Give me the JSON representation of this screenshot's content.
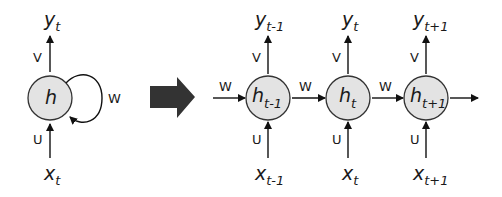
{
  "colors": {
    "node_fill": "#e3e3e3",
    "node_stroke": "#333333",
    "arrow": "#111111",
    "big_arrow": "#333333",
    "background": "#ffffff"
  },
  "folded": {
    "node": {
      "base": "h",
      "sub": ""
    },
    "output": {
      "base": "y",
      "sub": "t"
    },
    "input": {
      "base": "x",
      "sub": "t"
    },
    "weights": {
      "input": "U",
      "output": "V",
      "recurrent": "W"
    }
  },
  "transition_icon": "right-arrow-icon",
  "unfolded": {
    "incoming_weight": "W",
    "steps": [
      {
        "node": {
          "base": "h",
          "sub": "t-1"
        },
        "output": {
          "base": "y",
          "sub": "t-1"
        },
        "input": {
          "base": "x",
          "sub": "t-1"
        },
        "U": "U",
        "V": "V",
        "W_out": "W"
      },
      {
        "node": {
          "base": "h",
          "sub": "t"
        },
        "output": {
          "base": "y",
          "sub": "t"
        },
        "input": {
          "base": "x",
          "sub": "t"
        },
        "U": "U",
        "V": "V",
        "W_out": "W"
      },
      {
        "node": {
          "base": "h",
          "sub": "t+1"
        },
        "output": {
          "base": "y",
          "sub": "t+1"
        },
        "input": {
          "base": "x",
          "sub": "t+1"
        },
        "U": "U",
        "V": "V",
        "W_out": ""
      }
    ]
  }
}
